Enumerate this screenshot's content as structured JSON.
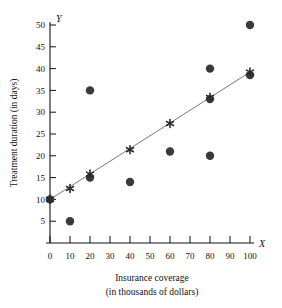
{
  "chart_data": {
    "type": "scatter",
    "title": "",
    "xlabel": "Insurance coverage",
    "xlabel_line2": "(in thousands of dollars)",
    "ylabel": "Treatment duration (in days)",
    "x_axis_letter": "X",
    "y_axis_letter": "Y",
    "xlim": [
      0,
      100
    ],
    "ylim": [
      0,
      50
    ],
    "grid": false,
    "legend": "none",
    "xticks": [
      0,
      10,
      20,
      30,
      40,
      50,
      60,
      70,
      80,
      90,
      100
    ],
    "xtick_labels": [
      "0",
      "10",
      "20",
      "30",
      "40",
      "50",
      "60",
      "70",
      "80",
      "90",
      "100"
    ],
    "yticks": [
      5,
      10,
      15,
      20,
      25,
      30,
      35,
      40,
      45,
      50
    ],
    "ytick_labels": [
      "5",
      "10",
      "15",
      "20",
      "25",
      "30",
      "35",
      "40",
      "45",
      "50"
    ],
    "series": [
      {
        "name": "observed",
        "marker": "filled-circle",
        "color": "#3a3a3a",
        "points": [
          {
            "x": 0,
            "y": 10
          },
          {
            "x": 10,
            "y": 5
          },
          {
            "x": 20,
            "y": 35
          },
          {
            "x": 20,
            "y": 15
          },
          {
            "x": 40,
            "y": 14
          },
          {
            "x": 60,
            "y": 21
          },
          {
            "x": 80,
            "y": 40
          },
          {
            "x": 80,
            "y": 33
          },
          {
            "x": 80,
            "y": 20
          },
          {
            "x": 100,
            "y": 50
          },
          {
            "x": 100,
            "y": 38.5
          }
        ]
      },
      {
        "name": "predicted",
        "marker": "asterisk",
        "color": "#2b2b2b",
        "points": [
          {
            "x": 0,
            "y": 10
          },
          {
            "x": 10,
            "y": 12.5
          },
          {
            "x": 20,
            "y": 15.8
          },
          {
            "x": 40,
            "y": 21.4
          },
          {
            "x": 60,
            "y": 27.4
          },
          {
            "x": 80,
            "y": 33.4
          },
          {
            "x": 100,
            "y": 39.2
          }
        ]
      }
    ],
    "regression_line": {
      "name": "least-squares-line",
      "color": "#6b6b6b",
      "x_start": 0,
      "y_start": 10,
      "x_end": 100,
      "y_end": 39.2
    }
  }
}
